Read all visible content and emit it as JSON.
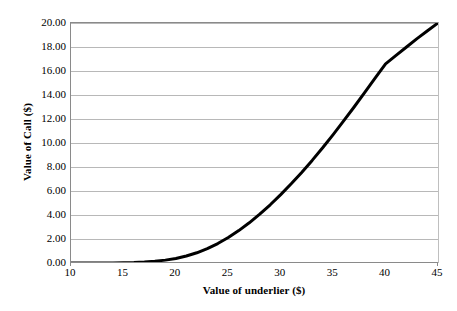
{
  "chart_data": {
    "type": "line",
    "title": "",
    "xlabel": "Value of underlier ($)",
    "ylabel": "Value of Call ($)",
    "xlim": [
      10,
      45
    ],
    "ylim": [
      0.0,
      20.0
    ],
    "xticks": [
      10,
      15,
      20,
      25,
      30,
      35,
      40,
      45
    ],
    "xtick_labels": [
      "10",
      "15",
      "20",
      "25",
      "30",
      "35",
      "40",
      "45"
    ],
    "yticks": [
      0.0,
      2.0,
      4.0,
      6.0,
      8.0,
      10.0,
      12.0,
      14.0,
      16.0,
      18.0,
      20.0
    ],
    "ytick_labels": [
      "0.00",
      "2.00",
      "4.00",
      "6.00",
      "8.00",
      "10.00",
      "12.00",
      "14.00",
      "16.00",
      "18.00",
      "20.00"
    ],
    "grid": "horizontal",
    "legend": null,
    "series": [
      {
        "name": "Value of Call",
        "color": "#000000",
        "line_width": 3,
        "x": [
          10,
          11,
          12,
          13,
          14,
          15,
          16,
          17,
          18,
          19,
          20,
          21,
          22,
          23,
          24,
          25,
          26,
          27,
          28,
          29,
          30,
          31,
          32,
          33,
          34,
          35,
          36,
          37,
          38,
          39,
          40,
          41,
          42,
          43,
          44,
          45
        ],
        "values": [
          0.0,
          0.0,
          0.0,
          0.0,
          0.01,
          0.02,
          0.04,
          0.08,
          0.14,
          0.24,
          0.38,
          0.58,
          0.85,
          1.2,
          1.62,
          2.12,
          2.7,
          3.35,
          4.07,
          4.85,
          5.7,
          6.6,
          7.55,
          8.55,
          9.6,
          10.7,
          11.85,
          13.0,
          14.2,
          15.4,
          16.6,
          17.3,
          18.0,
          18.7,
          19.35,
          20.0
        ]
      }
    ]
  },
  "axes": {
    "y_title": "Value of Call ($)",
    "x_title": "Value of underlier ($)"
  },
  "colors": {
    "curve": "#000000",
    "grid": "#b8b8b8",
    "axis": "#8a8a8a",
    "background": "#ffffff"
  }
}
